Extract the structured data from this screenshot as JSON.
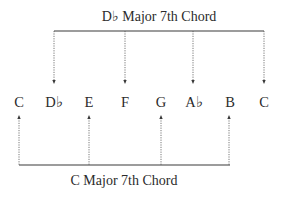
{
  "top_chord": {
    "title": "D♭ Major 7th Chord",
    "notes": [
      "D♭",
      "F",
      "A♭",
      "C"
    ]
  },
  "bottom_chord": {
    "title": "C Major 7th Chord",
    "notes": [
      "C",
      "E",
      "G",
      "B"
    ]
  },
  "scale": {
    "notes": [
      {
        "label": "C"
      },
      {
        "label": "D♭"
      },
      {
        "label": "E"
      },
      {
        "label": "F"
      },
      {
        "label": "G"
      },
      {
        "label": "A♭"
      },
      {
        "label": "B"
      },
      {
        "label": "C"
      }
    ]
  },
  "colors": {
    "line": "#3a3a3a",
    "text": "#2b2b2b"
  }
}
